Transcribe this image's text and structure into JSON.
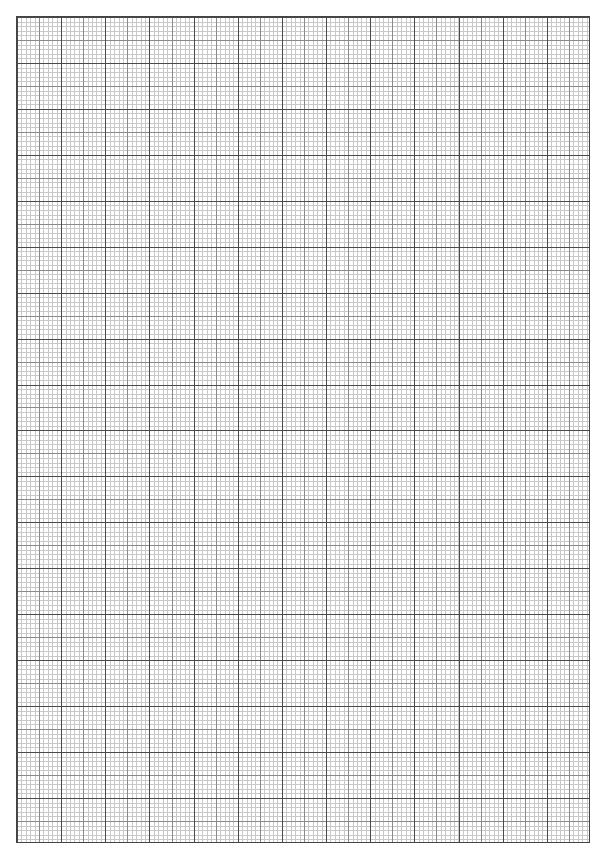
{
  "page": {
    "type": "graph-paper",
    "background": "#ffffff",
    "grid": {
      "major_columns": 13,
      "major_rows": 18,
      "minor_per_major": 10,
      "major_line_color": "#4a4a4a",
      "half_line_color": "#8a8a8a",
      "minor_line_color": "#c8c8c8"
    }
  }
}
